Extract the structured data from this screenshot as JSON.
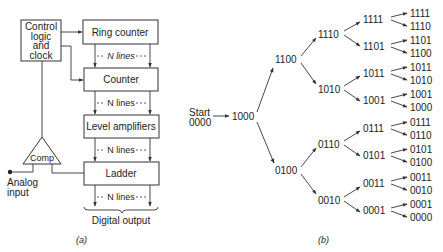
{
  "diagram_a": {
    "caption": "(a)",
    "control": [
      "Control",
      "logic",
      "and",
      "clock"
    ],
    "ring_counter": "Ring counter",
    "counter": "Counter",
    "level_amplifiers": "Level amplifiers",
    "ladder": "Ladder",
    "comp": "Comp",
    "n_lines": "N lines",
    "analog_input": [
      "Analog",
      "input"
    ],
    "digital_output": "Digital output"
  },
  "diagram_b": {
    "caption": "(b)",
    "start": [
      "Start",
      "0000"
    ],
    "level1": "1000",
    "level2": [
      "1100",
      "0100"
    ],
    "level3": [
      "1110",
      "1010",
      "0110",
      "0010"
    ],
    "level4": [
      "1111",
      "1101",
      "1011",
      "1001",
      "0111",
      "0101",
      "0011",
      "0001"
    ],
    "level5": [
      "1111",
      "1110",
      "1101",
      "1100",
      "1011",
      "1010",
      "1001",
      "1000",
      "0111",
      "0110",
      "0101",
      "0100",
      "0011",
      "0010",
      "0001",
      "0000"
    ]
  }
}
